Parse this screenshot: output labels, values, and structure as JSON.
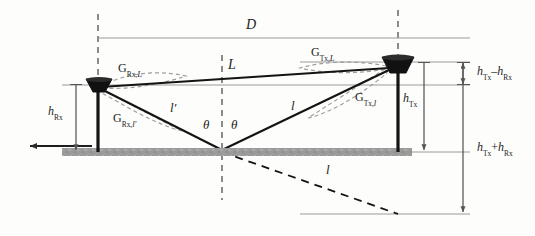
{
  "figure": {
    "type": "two-ray-ground-reflection-geometry-diagram",
    "background_color": "#fdfdfc",
    "ground_color": "#9a9a9a",
    "line_color": "#1d1d1d",
    "guide_color": "#8c8c8c",
    "gain_lobe_color": "#8f8f8f"
  },
  "labels": {
    "distance_D": "D",
    "los_path_L": "L",
    "reflected_near_l_prime": "l′",
    "reflected_far_l": "l",
    "image_path_l": "l",
    "theta_left": "θ",
    "theta_right": "θ",
    "gain_rx_L": {
      "base": "G",
      "sub": "Rx,",
      "var": "L"
    },
    "gain_rx_l_prime": {
      "base": "G",
      "sub": "Rx,",
      "var": "l′"
    },
    "gain_tx_L": {
      "base": "G",
      "sub": "Tx,",
      "var": "L"
    },
    "gain_tx_l": {
      "base": "G",
      "sub": "Tx,",
      "var": "l"
    },
    "height_rx": {
      "base": "h",
      "sub": "Rx"
    },
    "height_tx": {
      "base": "h",
      "sub": "Tx"
    },
    "height_difference": {
      "base1": "h",
      "sub1": "Tx",
      "op": "–",
      "base2": "h",
      "sub2": "Rx"
    },
    "height_sum": {
      "base1": "h",
      "sub1": "Tx",
      "op": "+",
      "base2": "h",
      "sub2": "Rx"
    }
  },
  "elements": {
    "rx_antenna": "receiver-horn-antenna",
    "tx_antenna": "transmitter-horn-antenna",
    "ground_plane": "ground-reflecting-surface",
    "mirror_image_baseline": "image-plane-baseline",
    "rx_mast": "receiver-mast",
    "tx_mast": "transmitter-mast"
  }
}
